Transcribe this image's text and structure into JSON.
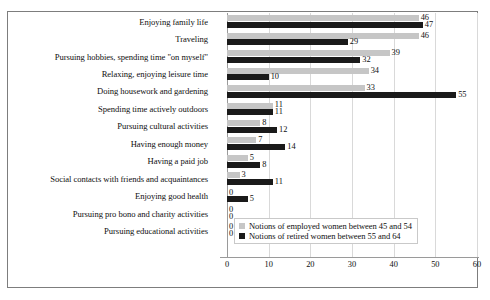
{
  "chart_data": {
    "type": "bar",
    "orientation": "horizontal",
    "title": "",
    "xlabel": "",
    "ylabel": "",
    "xlim": [
      0,
      60
    ],
    "xticks": [
      "0",
      "10",
      "20",
      "30",
      "40",
      "50",
      "60"
    ],
    "grid": true,
    "legend_position": "inside-bottom-right",
    "categories": [
      "Enjoying family life",
      "Traveling",
      "Pursuing hobbies, spending time \"on myself\"",
      "Relaxing, enjoying leisure time",
      "Doing housework and gardening",
      "Spending time actively outdoors",
      "Pursuing cultural activities",
      "Having enough money",
      "Having a paid job",
      "Social contacts with friends and acquaintances",
      "Enjoying good health",
      "Pursuing pro bono and charity activities",
      "Pursuing educational activities"
    ],
    "series": [
      {
        "name": "Notions of employed women between 45 and 54",
        "color": "#c6c6c6",
        "values": [
          46,
          46,
          39,
          34,
          33,
          11,
          8,
          7,
          5,
          3,
          0,
          0,
          0
        ]
      },
      {
        "name": "Notions of retired women between 55 and 64",
        "color": "#1a1a1a",
        "values": [
          47,
          29,
          32,
          10,
          55,
          11,
          12,
          14,
          8,
          11,
          5,
          0,
          0
        ]
      }
    ]
  },
  "legend": {
    "items": [
      {
        "label": "Notions of employed women between 45 and 54"
      },
      {
        "label": "Notions of retired women between 55 and 64"
      }
    ]
  }
}
